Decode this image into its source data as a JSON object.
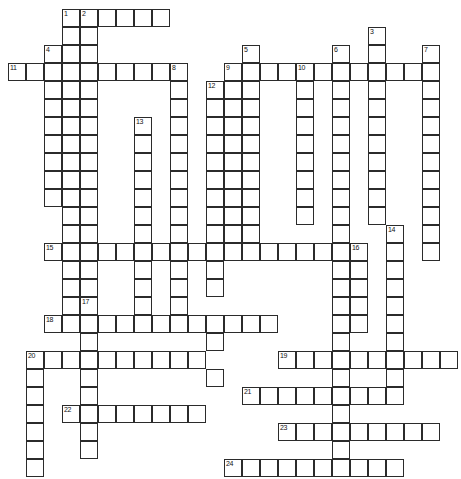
{
  "puzzle": {
    "title": "Crossword Grid",
    "cell_size": 18,
    "origin": {
      "x": 8,
      "y": 9
    },
    "columns": 25,
    "rows": 26,
    "grid_color": "#2b2b2b",
    "cell_color": "#ffffff",
    "background": "#ffffff",
    "clue_numbers": [
      1,
      2,
      3,
      4,
      5,
      6,
      7,
      8,
      9,
      10,
      11,
      12,
      13,
      14,
      15,
      16,
      17,
      18,
      19,
      20,
      21,
      22,
      23,
      24
    ],
    "entries": [
      {
        "number": 1,
        "direction": "across",
        "col": 3,
        "row": 0,
        "length": 6
      },
      {
        "number": 1,
        "direction": "down",
        "col": 3,
        "row": 0,
        "length": 16
      },
      {
        "number": 2,
        "direction": "down",
        "col": 4,
        "row": 0,
        "length": 16
      },
      {
        "number": 3,
        "direction": "down",
        "col": 20,
        "row": 1,
        "length": 11
      },
      {
        "number": 4,
        "direction": "across",
        "col": 2,
        "row": 2,
        "length": 2
      },
      {
        "number": 4,
        "direction": "down",
        "col": 2,
        "row": 2,
        "length": 9
      },
      {
        "number": 5,
        "direction": "down",
        "col": 13,
        "row": 2,
        "length": 11
      },
      {
        "number": 6,
        "direction": "down",
        "col": 18,
        "row": 2,
        "length": 10
      },
      {
        "number": 7,
        "direction": "down",
        "col": 23,
        "row": 2,
        "length": 11
      },
      {
        "number": 8,
        "direction": "down",
        "col": 9,
        "row": 3,
        "length": 11
      },
      {
        "number": 9,
        "direction": "across",
        "col": 12,
        "row": 3,
        "length": 12
      },
      {
        "number": 9,
        "direction": "down",
        "col": 12,
        "row": 3,
        "length": 9
      },
      {
        "number": 10,
        "direction": "down",
        "col": 16,
        "row": 3,
        "length": 9
      },
      {
        "number": 11,
        "direction": "across",
        "col": 0,
        "row": 3,
        "length": 9
      },
      {
        "number": 12,
        "direction": "down",
        "col": 11,
        "row": 4,
        "length": 11
      },
      {
        "number": 13,
        "direction": "down",
        "col": 7,
        "row": 6,
        "length": 10
      },
      {
        "number": 14,
        "direction": "down",
        "col": 21,
        "row": 12,
        "length": 7
      },
      {
        "number": 15,
        "direction": "across",
        "col": 2,
        "row": 13,
        "length": 18
      },
      {
        "number": 16,
        "direction": "down",
        "col": 19,
        "row": 13,
        "length": 7
      },
      {
        "number": 17,
        "direction": "down",
        "col": 4,
        "row": 16,
        "length": 8
      },
      {
        "number": 18,
        "direction": "across",
        "col": 2,
        "row": 17,
        "length": 13
      },
      {
        "number": 19,
        "direction": "across",
        "col": 15,
        "row": 19,
        "length": 10
      },
      {
        "number": 20,
        "direction": "across",
        "col": 1,
        "row": 19,
        "length": 10
      },
      {
        "number": 20,
        "direction": "down",
        "col": 1,
        "row": 19,
        "length": 7
      },
      {
        "number": 21,
        "direction": "across",
        "col": 13,
        "row": 21,
        "length": 9
      },
      {
        "number": 22,
        "direction": "across",
        "col": 3,
        "row": 22,
        "length": 8
      },
      {
        "number": 23,
        "direction": "across",
        "col": 15,
        "row": 23,
        "length": 9
      },
      {
        "number": 24,
        "direction": "across",
        "col": 12,
        "row": 25,
        "length": 10
      }
    ],
    "cells": [
      {
        "c": 3,
        "r": 0,
        "n": "1"
      },
      {
        "c": 4,
        "r": 0,
        "n": "2"
      },
      {
        "c": 5,
        "r": 0
      },
      {
        "c": 6,
        "r": 0
      },
      {
        "c": 7,
        "r": 0
      },
      {
        "c": 8,
        "r": 0
      },
      {
        "c": 3,
        "r": 1
      },
      {
        "c": 4,
        "r": 1
      },
      {
        "c": 20,
        "r": 1,
        "n": "3"
      },
      {
        "c": 2,
        "r": 2,
        "n": "4"
      },
      {
        "c": 3,
        "r": 2
      },
      {
        "c": 4,
        "r": 2
      },
      {
        "c": 13,
        "r": 2,
        "n": "5"
      },
      {
        "c": 18,
        "r": 2,
        "n": "6"
      },
      {
        "c": 20,
        "r": 2
      },
      {
        "c": 23,
        "r": 2,
        "n": "7"
      },
      {
        "c": 0,
        "r": 3,
        "n": "11"
      },
      {
        "c": 1,
        "r": 3
      },
      {
        "c": 2,
        "r": 3
      },
      {
        "c": 3,
        "r": 3
      },
      {
        "c": 4,
        "r": 3
      },
      {
        "c": 5,
        "r": 3
      },
      {
        "c": 6,
        "r": 3
      },
      {
        "c": 7,
        "r": 3
      },
      {
        "c": 8,
        "r": 3
      },
      {
        "c": 9,
        "r": 3,
        "n": "8"
      },
      {
        "c": 12,
        "r": 3,
        "n": "9"
      },
      {
        "c": 13,
        "r": 3
      },
      {
        "c": 14,
        "r": 3
      },
      {
        "c": 15,
        "r": 3
      },
      {
        "c": 16,
        "r": 3,
        "n": "10"
      },
      {
        "c": 17,
        "r": 3
      },
      {
        "c": 18,
        "r": 3
      },
      {
        "c": 19,
        "r": 3
      },
      {
        "c": 20,
        "r": 3
      },
      {
        "c": 21,
        "r": 3
      },
      {
        "c": 22,
        "r": 3
      },
      {
        "c": 23,
        "r": 3
      },
      {
        "c": 2,
        "r": 4
      },
      {
        "c": 3,
        "r": 4
      },
      {
        "c": 4,
        "r": 4
      },
      {
        "c": 9,
        "r": 4
      },
      {
        "c": 11,
        "r": 4,
        "n": "12"
      },
      {
        "c": 12,
        "r": 4
      },
      {
        "c": 13,
        "r": 4
      },
      {
        "c": 16,
        "r": 4
      },
      {
        "c": 18,
        "r": 4
      },
      {
        "c": 20,
        "r": 4
      },
      {
        "c": 23,
        "r": 4
      },
      {
        "c": 2,
        "r": 5
      },
      {
        "c": 3,
        "r": 5
      },
      {
        "c": 4,
        "r": 5
      },
      {
        "c": 9,
        "r": 5
      },
      {
        "c": 11,
        "r": 5
      },
      {
        "c": 12,
        "r": 5
      },
      {
        "c": 13,
        "r": 5
      },
      {
        "c": 16,
        "r": 5
      },
      {
        "c": 18,
        "r": 5
      },
      {
        "c": 20,
        "r": 5
      },
      {
        "c": 23,
        "r": 5
      },
      {
        "c": 2,
        "r": 6
      },
      {
        "c": 3,
        "r": 6
      },
      {
        "c": 4,
        "r": 6
      },
      {
        "c": 7,
        "r": 6,
        "n": "13"
      },
      {
        "c": 9,
        "r": 6
      },
      {
        "c": 11,
        "r": 6
      },
      {
        "c": 12,
        "r": 6
      },
      {
        "c": 13,
        "r": 6
      },
      {
        "c": 16,
        "r": 6
      },
      {
        "c": 18,
        "r": 6
      },
      {
        "c": 20,
        "r": 6
      },
      {
        "c": 23,
        "r": 6
      },
      {
        "c": 2,
        "r": 7
      },
      {
        "c": 3,
        "r": 7
      },
      {
        "c": 4,
        "r": 7
      },
      {
        "c": 7,
        "r": 7
      },
      {
        "c": 9,
        "r": 7
      },
      {
        "c": 11,
        "r": 7
      },
      {
        "c": 12,
        "r": 7
      },
      {
        "c": 13,
        "r": 7
      },
      {
        "c": 16,
        "r": 7
      },
      {
        "c": 18,
        "r": 7
      },
      {
        "c": 20,
        "r": 7
      },
      {
        "c": 23,
        "r": 7
      },
      {
        "c": 2,
        "r": 8
      },
      {
        "c": 3,
        "r": 8
      },
      {
        "c": 4,
        "r": 8
      },
      {
        "c": 7,
        "r": 8
      },
      {
        "c": 9,
        "r": 8
      },
      {
        "c": 11,
        "r": 8
      },
      {
        "c": 12,
        "r": 8
      },
      {
        "c": 13,
        "r": 8
      },
      {
        "c": 16,
        "r": 8
      },
      {
        "c": 18,
        "r": 8
      },
      {
        "c": 20,
        "r": 8
      },
      {
        "c": 23,
        "r": 8
      },
      {
        "c": 2,
        "r": 9
      },
      {
        "c": 3,
        "r": 9
      },
      {
        "c": 4,
        "r": 9
      },
      {
        "c": 7,
        "r": 9
      },
      {
        "c": 9,
        "r": 9
      },
      {
        "c": 11,
        "r": 9
      },
      {
        "c": 12,
        "r": 9
      },
      {
        "c": 13,
        "r": 9
      },
      {
        "c": 16,
        "r": 9
      },
      {
        "c": 18,
        "r": 9
      },
      {
        "c": 20,
        "r": 9
      },
      {
        "c": 23,
        "r": 9
      },
      {
        "c": 2,
        "r": 10
      },
      {
        "c": 3,
        "r": 10
      },
      {
        "c": 4,
        "r": 10
      },
      {
        "c": 7,
        "r": 10
      },
      {
        "c": 9,
        "r": 10
      },
      {
        "c": 11,
        "r": 10
      },
      {
        "c": 12,
        "r": 10
      },
      {
        "c": 13,
        "r": 10
      },
      {
        "c": 16,
        "r": 10
      },
      {
        "c": 18,
        "r": 10
      },
      {
        "c": 20,
        "r": 10
      },
      {
        "c": 23,
        "r": 10
      },
      {
        "c": 3,
        "r": 11
      },
      {
        "c": 4,
        "r": 11
      },
      {
        "c": 7,
        "r": 11
      },
      {
        "c": 9,
        "r": 11
      },
      {
        "c": 11,
        "r": 11
      },
      {
        "c": 12,
        "r": 11
      },
      {
        "c": 13,
        "r": 11
      },
      {
        "c": 16,
        "r": 11
      },
      {
        "c": 18,
        "r": 11
      },
      {
        "c": 20,
        "r": 11
      },
      {
        "c": 23,
        "r": 11
      },
      {
        "c": 3,
        "r": 12
      },
      {
        "c": 4,
        "r": 12
      },
      {
        "c": 7,
        "r": 12
      },
      {
        "c": 9,
        "r": 12
      },
      {
        "c": 11,
        "r": 12
      },
      {
        "c": 12,
        "r": 12
      },
      {
        "c": 13,
        "r": 12
      },
      {
        "c": 18,
        "r": 12
      },
      {
        "c": 21,
        "r": 12,
        "n": "14"
      },
      {
        "c": 23,
        "r": 12
      },
      {
        "c": 2,
        "r": 13,
        "n": "15"
      },
      {
        "c": 3,
        "r": 13
      },
      {
        "c": 4,
        "r": 13
      },
      {
        "c": 5,
        "r": 13
      },
      {
        "c": 6,
        "r": 13
      },
      {
        "c": 7,
        "r": 13
      },
      {
        "c": 8,
        "r": 13
      },
      {
        "c": 9,
        "r": 13
      },
      {
        "c": 10,
        "r": 13
      },
      {
        "c": 11,
        "r": 13
      },
      {
        "c": 12,
        "r": 13
      },
      {
        "c": 13,
        "r": 13
      },
      {
        "c": 14,
        "r": 13
      },
      {
        "c": 15,
        "r": 13
      },
      {
        "c": 16,
        "r": 13
      },
      {
        "c": 17,
        "r": 13
      },
      {
        "c": 18,
        "r": 13
      },
      {
        "c": 19,
        "r": 13,
        "n": "16"
      },
      {
        "c": 21,
        "r": 13
      },
      {
        "c": 23,
        "r": 13
      },
      {
        "c": 3,
        "r": 14
      },
      {
        "c": 4,
        "r": 14
      },
      {
        "c": 7,
        "r": 14
      },
      {
        "c": 9,
        "r": 14
      },
      {
        "c": 11,
        "r": 14
      },
      {
        "c": 18,
        "r": 14
      },
      {
        "c": 19,
        "r": 14
      },
      {
        "c": 21,
        "r": 14
      },
      {
        "c": 3,
        "r": 15
      },
      {
        "c": 4,
        "r": 15
      },
      {
        "c": 7,
        "r": 15
      },
      {
        "c": 9,
        "r": 15
      },
      {
        "c": 11,
        "r": 15
      },
      {
        "c": 18,
        "r": 15
      },
      {
        "c": 19,
        "r": 15
      },
      {
        "c": 21,
        "r": 15
      },
      {
        "c": 3,
        "r": 16
      },
      {
        "c": 4,
        "r": 16,
        "n": "17"
      },
      {
        "c": 7,
        "r": 16
      },
      {
        "c": 9,
        "r": 16
      },
      {
        "c": 18,
        "r": 16
      },
      {
        "c": 19,
        "r": 16
      },
      {
        "c": 21,
        "r": 16
      },
      {
        "c": 2,
        "r": 17,
        "n": "18"
      },
      {
        "c": 3,
        "r": 17
      },
      {
        "c": 4,
        "r": 17
      },
      {
        "c": 5,
        "r": 17
      },
      {
        "c": 6,
        "r": 17
      },
      {
        "c": 7,
        "r": 17
      },
      {
        "c": 8,
        "r": 17
      },
      {
        "c": 9,
        "r": 17
      },
      {
        "c": 10,
        "r": 17
      },
      {
        "c": 11,
        "r": 17
      },
      {
        "c": 12,
        "r": 17
      },
      {
        "c": 13,
        "r": 17
      },
      {
        "c": 14,
        "r": 17
      },
      {
        "c": 18,
        "r": 17
      },
      {
        "c": 19,
        "r": 17
      },
      {
        "c": 21,
        "r": 17
      },
      {
        "c": 4,
        "r": 18
      },
      {
        "c": 11,
        "r": 18
      },
      {
        "c": 18,
        "r": 18
      },
      {
        "c": 21,
        "r": 18
      },
      {
        "c": 1,
        "r": 19,
        "n": "20"
      },
      {
        "c": 2,
        "r": 19
      },
      {
        "c": 3,
        "r": 19
      },
      {
        "c": 4,
        "r": 19
      },
      {
        "c": 5,
        "r": 19
      },
      {
        "c": 6,
        "r": 19
      },
      {
        "c": 7,
        "r": 19
      },
      {
        "c": 8,
        "r": 19
      },
      {
        "c": 9,
        "r": 19
      },
      {
        "c": 10,
        "r": 19
      },
      {
        "c": 15,
        "r": 19,
        "n": "19"
      },
      {
        "c": 16,
        "r": 19
      },
      {
        "c": 17,
        "r": 19
      },
      {
        "c": 18,
        "r": 19
      },
      {
        "c": 19,
        "r": 19
      },
      {
        "c": 20,
        "r": 19
      },
      {
        "c": 21,
        "r": 19
      },
      {
        "c": 22,
        "r": 19
      },
      {
        "c": 23,
        "r": 19
      },
      {
        "c": 24,
        "r": 19
      },
      {
        "c": 1,
        "r": 20
      },
      {
        "c": 4,
        "r": 20
      },
      {
        "c": 11,
        "r": 20
      },
      {
        "c": 18,
        "r": 20
      },
      {
        "c": 21,
        "r": 20
      },
      {
        "c": 1,
        "r": 21
      },
      {
        "c": 4,
        "r": 21
      },
      {
        "c": 13,
        "r": 21,
        "n": "21"
      },
      {
        "c": 14,
        "r": 21
      },
      {
        "c": 15,
        "r": 21
      },
      {
        "c": 16,
        "r": 21
      },
      {
        "c": 17,
        "r": 21
      },
      {
        "c": 18,
        "r": 21
      },
      {
        "c": 19,
        "r": 21
      },
      {
        "c": 20,
        "r": 21
      },
      {
        "c": 21,
        "r": 21
      },
      {
        "c": 1,
        "r": 22
      },
      {
        "c": 3,
        "r": 22,
        "n": "22"
      },
      {
        "c": 4,
        "r": 22
      },
      {
        "c": 5,
        "r": 22
      },
      {
        "c": 6,
        "r": 22
      },
      {
        "c": 7,
        "r": 22
      },
      {
        "c": 8,
        "r": 22
      },
      {
        "c": 9,
        "r": 22
      },
      {
        "c": 10,
        "r": 22
      },
      {
        "c": 18,
        "r": 22
      },
      {
        "c": 1,
        "r": 23
      },
      {
        "c": 4,
        "r": 23
      },
      {
        "c": 15,
        "r": 23,
        "n": "23"
      },
      {
        "c": 16,
        "r": 23
      },
      {
        "c": 17,
        "r": 23
      },
      {
        "c": 18,
        "r": 23
      },
      {
        "c": 19,
        "r": 23
      },
      {
        "c": 20,
        "r": 23
      },
      {
        "c": 21,
        "r": 23
      },
      {
        "c": 22,
        "r": 23
      },
      {
        "c": 23,
        "r": 23
      },
      {
        "c": 1,
        "r": 24
      },
      {
        "c": 4,
        "r": 24
      },
      {
        "c": 18,
        "r": 24
      },
      {
        "c": 1,
        "r": 25
      },
      {
        "c": 12,
        "r": 25,
        "n": "24"
      },
      {
        "c": 13,
        "r": 25
      },
      {
        "c": 14,
        "r": 25
      },
      {
        "c": 15,
        "r": 25
      },
      {
        "c": 16,
        "r": 25
      },
      {
        "c": 17,
        "r": 25
      },
      {
        "c": 18,
        "r": 25
      },
      {
        "c": 19,
        "r": 25
      },
      {
        "c": 20,
        "r": 25
      },
      {
        "c": 21,
        "r": 25
      }
    ]
  }
}
